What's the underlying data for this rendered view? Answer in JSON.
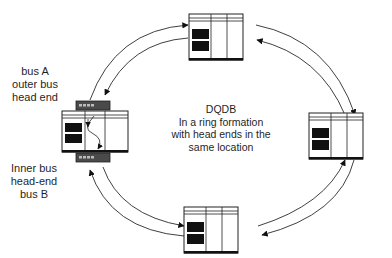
{
  "diagram": {
    "title": "DQDB",
    "description_lines": [
      "DQDB",
      "In a ring formation",
      "with head ends in the",
      "same location"
    ],
    "labels": {
      "bus_a": [
        "bus A",
        "outer bus",
        "head end"
      ],
      "bus_b": [
        "Inner bus",
        "head-end",
        "bus B"
      ]
    },
    "nodes": [
      {
        "id": "node-left",
        "role": "head-end node (bus A and bus B)"
      },
      {
        "id": "node-top",
        "role": "station"
      },
      {
        "id": "node-right",
        "role": "station"
      },
      {
        "id": "node-bottom",
        "role": "station"
      }
    ],
    "connections": [
      {
        "from": "node-left",
        "to": "node-top",
        "arrows": "double arc, outer toward top, inner toward left"
      },
      {
        "from": "node-top",
        "to": "node-right",
        "arrows": "double arc, outer toward right, inner toward top"
      },
      {
        "from": "node-right",
        "to": "node-bottom",
        "arrows": "double arc, outer toward bottom, inner toward right"
      },
      {
        "from": "node-bottom",
        "to": "node-left",
        "arrows": "double arc, outer toward left, inner toward bottom"
      }
    ],
    "colors": {
      "line": "#2a2a2a",
      "fill_dark": "#111111",
      "head_end": "#4a4a4a",
      "background": "#ffffff"
    }
  }
}
